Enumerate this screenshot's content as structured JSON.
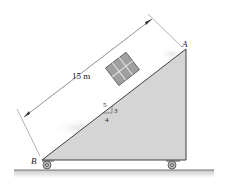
{
  "diagram": {
    "type": "inclined-plane-cart",
    "dimension_label": "15 m",
    "point_labels": {
      "top": "A",
      "bottom": "B"
    },
    "slope": {
      "hypotenuse": "5",
      "rise": "3",
      "run": "4"
    },
    "colors": {
      "incline_fill": "#d7d7d7",
      "line": "#2a2a2a",
      "box_fill": "#9c9c9c",
      "ground_shadow": "#c9c9c9"
    }
  }
}
